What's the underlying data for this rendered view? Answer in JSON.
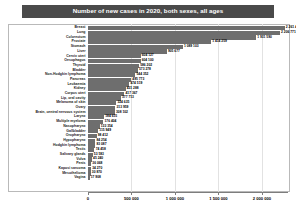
{
  "chart_data": {
    "type": "bar",
    "orientation": "horizontal",
    "title": "Number of new cases in 2020, both sexes, all ages",
    "xlabel": "",
    "ylabel": "",
    "xlim": [
      0,
      2300000
    ],
    "grid": true,
    "legend": false,
    "bar_color": "#6e6e6e",
    "title_bg": "#4a4a4a",
    "title_color": "#ffffff",
    "xticks": [
      0,
      500000,
      1000000,
      1500000,
      2000000
    ],
    "xtick_labels": [
      "0",
      "500 000",
      "1 000 000",
      "1 500 000",
      "2 000 000"
    ],
    "categories": [
      "Breast",
      "Lung",
      "Colorectum",
      "Prostate",
      "Stomach",
      "Liver",
      "Cervix uteri",
      "Oesophagus",
      "Thyroid",
      "Bladder",
      "Non-Hodgkin lymphoma",
      "Pancreas",
      "Leukaemia",
      "Kidney",
      "Corpus uteri",
      "Lip, oral cavity",
      "Melanoma of skin",
      "Ovary",
      "Brain, central nervous system",
      "Larynx",
      "Multiple myeloma",
      "Nasopharynx",
      "Gallbladder",
      "Oropharynx",
      "Hypopharynx",
      "Hodgkin lymphoma",
      "Testis",
      "Salivary glands",
      "Vulva",
      "Penis",
      "Kaposi sarcoma",
      "Mesothelioma",
      "Vagina"
    ],
    "values": [
      2261419,
      2206771,
      1931590,
      1414259,
      1089103,
      905677,
      604127,
      604100,
      586202,
      573278,
      544352,
      495773,
      474519,
      431288,
      417367,
      377713,
      324635,
      313959,
      308102,
      184615,
      176404,
      133354,
      115949,
      98412,
      84254,
      83087,
      74458,
      53583,
      45240,
      36068,
      34270,
      30870,
      17908
    ],
    "value_labels": [
      "2 261 419",
      "2 206 771",
      "1 931 590",
      "1 414 259",
      "1 089 103",
      "905 677",
      "604 127",
      "604 100",
      "586 202",
      "573 278",
      "544 352",
      "495 773",
      "474 519",
      "431 288",
      "417 367",
      "377 713",
      "324 635",
      "313 959",
      "308 102",
      "184 615",
      "176 404",
      "133 354",
      "115 949",
      "98 412",
      "84 254",
      "83 087",
      "74 458",
      "53 583",
      "45 240",
      "36 068",
      "34 270",
      "30 870",
      "17 908"
    ]
  }
}
